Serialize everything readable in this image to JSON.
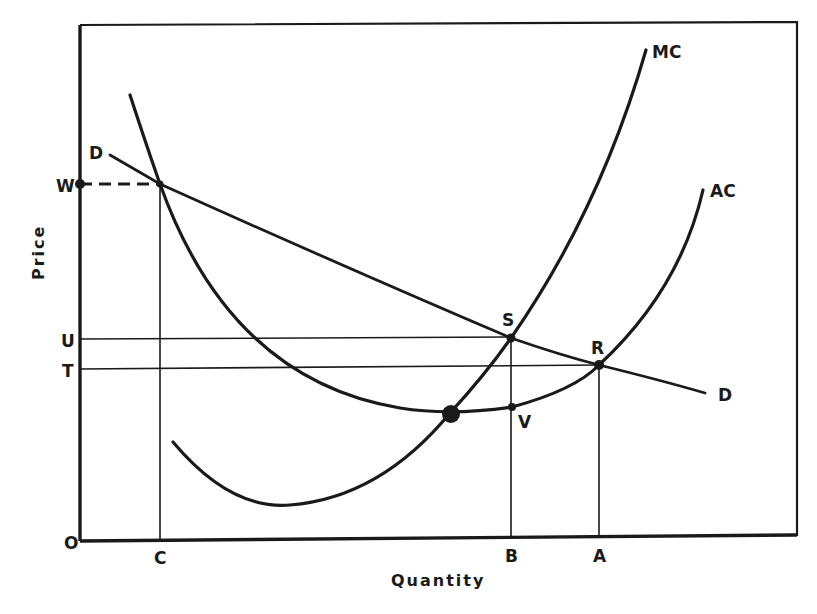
{
  "diagram": {
    "axes": {
      "x_title": "Quantity",
      "y_title": "Price",
      "origin_label": "O"
    },
    "price_labels": {
      "W": "W",
      "U": "U",
      "T": "T"
    },
    "quantity_labels": {
      "C": "C",
      "B": "B",
      "A": "A"
    },
    "curves": {
      "MC": "MC",
      "AC": "AC",
      "D_left": "D",
      "D_right": "D"
    },
    "points": {
      "S": "S",
      "R": "R",
      "V": "V"
    },
    "colors": {
      "ink": "#1a1a1a",
      "background": "#ffffff"
    }
  }
}
